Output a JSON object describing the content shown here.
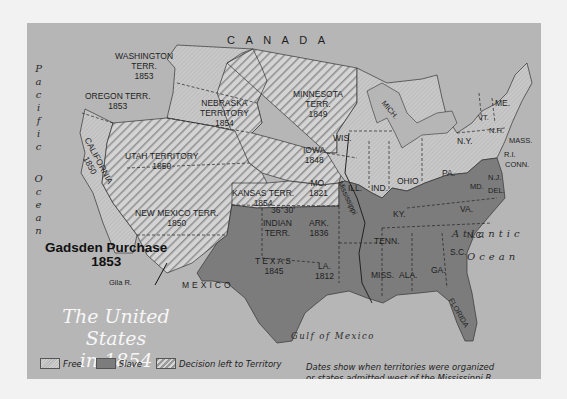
{
  "map": {
    "title_line1": "The United States",
    "title_line2": "in 1854",
    "regions_outside": {
      "canada": "C    A    N    A    D    A",
      "mexico": "MEXICO",
      "pacific": "Pacific",
      "pacific_ocean": "Ocean",
      "atlantic": "Atlantic",
      "atlantic_ocean": "Ocean",
      "gulf": "Gulf of Mexico"
    },
    "territories": [
      {
        "name": "WASHINGTON TERR.",
        "year": "1853",
        "status": "Free"
      },
      {
        "name": "OREGON TERR.",
        "year": "1853",
        "status": "Free"
      },
      {
        "name": "CALIFORNIA",
        "year": "1850",
        "status": "Free"
      },
      {
        "name": "UTAH TERRITORY",
        "year": "1850",
        "status": "Decision left to Territory"
      },
      {
        "name": "NEW MEXICO TERR.",
        "year": "1850",
        "status": "Decision left to Territory"
      },
      {
        "name": "NEBRASKA TERRITORY",
        "year": "1854",
        "status": "Decision left to Territory"
      },
      {
        "name": "KANSAS TERR.",
        "year": "1854",
        "status": "Decision left to Territory"
      },
      {
        "name": "MINNESOTA TERR.",
        "year": "1849",
        "status": "Free"
      },
      {
        "name": "IOWA",
        "year": "1848",
        "status": "Free"
      },
      {
        "name": "MO.",
        "year": "1821",
        "status": "Slave"
      },
      {
        "name": "ARK.",
        "year": "1836",
        "status": "Slave"
      },
      {
        "name": "INDIAN TERR.",
        "year": "",
        "status": "Slave"
      },
      {
        "name": "TEXAS",
        "year": "1845",
        "status": "Slave"
      },
      {
        "name": "LA.",
        "year": "1812",
        "status": "Slave"
      }
    ],
    "states_east": {
      "wis": "WIS.",
      "mich": "MICH.",
      "ill": "ILL.",
      "ind": "IND.",
      "ohio": "OHIO",
      "pa": "PA.",
      "ny": "N.Y.",
      "vt": "VT.",
      "nh": "N.H.",
      "me": "ME.",
      "mass": "MASS.",
      "ri": "R.I.",
      "conn": "CONN.",
      "nj": "N.J.",
      "del": "DEL.",
      "md": "MD.",
      "va": "VA.",
      "ky": "KY.",
      "tenn": "TENN.",
      "nc": "N.C.",
      "sc": "S.C.",
      "ga": "GA.",
      "ala": "ALA.",
      "miss": "MISS.",
      "florida": "FLORIDA"
    },
    "line_label": "36°30'",
    "river_label": "Mississippi",
    "gila_label": "Gila R.",
    "gadsden": {
      "label": "Gadsden Purchase",
      "year": "1853"
    },
    "legend": [
      {
        "key": "free",
        "label": "Free"
      },
      {
        "key": "slave",
        "label": "Slave"
      },
      {
        "key": "territory",
        "label": "Decision left to Territory"
      }
    ],
    "note_line1": "Dates show when territories were organized",
    "note_line2": "or states admitted west of the Mississippi R.",
    "colors": {
      "background": "#b6b6b6",
      "free": "#c4c4c4",
      "slave": "#7c7c7c",
      "territory_stripe_dark": "#9a9a9a",
      "territory_stripe_light": "#d6d6d6",
      "page": "#f2f2f2"
    }
  }
}
